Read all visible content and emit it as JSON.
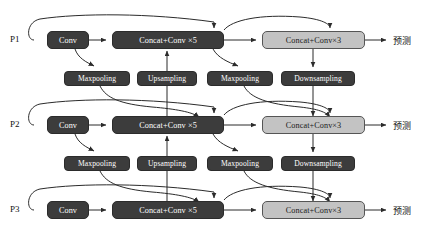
{
  "diagram": {
    "type": "flow-diagram",
    "canvas": {
      "width": 422,
      "height": 247,
      "background": "#ffffff"
    },
    "colors": {
      "dark_node_fill": "#3c3c3c",
      "dark_node_text": "#ffffff",
      "light_node_fill": "#c3c3c3",
      "light_node_text": "#1a1a1a",
      "wire": "#2b2b2b"
    },
    "rows": [
      {
        "input_label": "P1",
        "output_label": "预测",
        "y": 40,
        "main_nodes": [
          {
            "name": "conv",
            "label": "Conv",
            "style": "dark"
          },
          {
            "name": "concat-conv-5",
            "label": "Concat+Conv ×5",
            "style": "dark"
          },
          {
            "name": "concat-conv-3",
            "label": "Concat+Conv×3",
            "style": "light"
          }
        ]
      },
      {
        "input_label": "P2",
        "output_label": "预测",
        "y": 125,
        "main_nodes": [
          {
            "name": "conv",
            "label": "Conv",
            "style": "dark"
          },
          {
            "name": "concat-conv-5",
            "label": "Concat+Conv ×5",
            "style": "dark"
          },
          {
            "name": "concat-conv-3",
            "label": "Concat+Conv×3",
            "style": "light"
          }
        ]
      },
      {
        "input_label": "P3",
        "output_label": "预测",
        "y": 210,
        "main_nodes": [
          {
            "name": "conv",
            "label": "Conv",
            "style": "dark"
          },
          {
            "name": "concat-conv-5",
            "label": "Concat+Conv ×5",
            "style": "dark"
          },
          {
            "name": "concat-conv-3",
            "label": "Concat+Conv×3",
            "style": "light"
          }
        ]
      }
    ],
    "connector_bands": [
      {
        "y": 78,
        "nodes": [
          {
            "name": "maxpooling-left",
            "label": "Maxpooling"
          },
          {
            "name": "upsampling",
            "label": "Upsampling"
          },
          {
            "name": "maxpooling-right",
            "label": "Maxpooling"
          },
          {
            "name": "downsampling",
            "label": "Downsampling"
          }
        ]
      },
      {
        "y": 163,
        "nodes": [
          {
            "name": "maxpooling-left",
            "label": "Maxpooling"
          },
          {
            "name": "upsampling",
            "label": "Upsampling"
          },
          {
            "name": "maxpooling-right",
            "label": "Maxpooling"
          },
          {
            "name": "downsampling",
            "label": "Downsampling"
          }
        ]
      }
    ]
  }
}
